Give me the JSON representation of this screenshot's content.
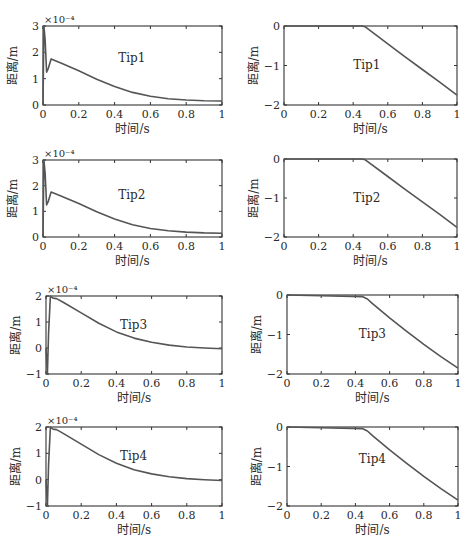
{
  "figure": {
    "xlabel": "时间/s",
    "ylabel": "距离/m",
    "exponent_label": "×10⁻⁴",
    "line_color": "#555555",
    "axis_color": "#333333"
  },
  "chart_data": [
    {
      "type": "line",
      "id": "left-1",
      "annotation": "Tip1",
      "xlabel": "时间/s",
      "ylabel": "距离/m",
      "y_scale_label": "×10⁻⁴",
      "xlim": [
        0,
        1
      ],
      "ylim": [
        0,
        3
      ],
      "xticks": [
        "0",
        "0.2",
        "0.4",
        "0.6",
        "0.8",
        "1"
      ],
      "yticks": [
        "0",
        "1",
        "2",
        "3"
      ],
      "grid": false,
      "x": [
        0,
        0.005,
        0.012,
        0.02,
        0.03,
        0.045,
        0.1,
        0.2,
        0.3,
        0.4,
        0.5,
        0.6,
        0.7,
        0.8,
        0.9,
        1.0
      ],
      "values": [
        0,
        3.0,
        2.5,
        1.25,
        1.4,
        1.75,
        1.6,
        1.3,
        0.98,
        0.7,
        0.48,
        0.33,
        0.24,
        0.19,
        0.16,
        0.15
      ]
    },
    {
      "type": "line",
      "id": "right-1",
      "annotation": "Tip1",
      "xlabel": "时间/s",
      "ylabel": "距离/m",
      "xlim": [
        0,
        1
      ],
      "ylim": [
        -2,
        0
      ],
      "xticks": [
        "0",
        "0.2",
        "0.4",
        "0.6",
        "0.8",
        "1"
      ],
      "yticks": [
        "0",
        "-1",
        "-1",
        "-2"
      ],
      "yticks_values": [
        0,
        -1,
        -2
      ],
      "grid": false,
      "x": [
        0,
        0.45,
        0.47,
        0.6,
        0.7,
        0.8,
        0.9,
        1.0
      ],
      "values": [
        0,
        0,
        -0.02,
        -0.45,
        -0.78,
        -1.1,
        -1.42,
        -1.75
      ]
    },
    {
      "type": "line",
      "id": "left-2",
      "annotation": "Tip2",
      "xlabel": "时间/s",
      "ylabel": "距离/m",
      "y_scale_label": "×10⁻⁴",
      "xlim": [
        0,
        1
      ],
      "ylim": [
        0,
        3
      ],
      "xticks": [
        "0",
        "0.2",
        "0.4",
        "0.6",
        "0.8",
        "1"
      ],
      "yticks": [
        "0",
        "1",
        "2",
        "3"
      ],
      "grid": false,
      "x": [
        0,
        0.005,
        0.012,
        0.02,
        0.03,
        0.045,
        0.1,
        0.2,
        0.3,
        0.4,
        0.5,
        0.6,
        0.7,
        0.8,
        0.9,
        1.0
      ],
      "values": [
        0,
        3.0,
        2.5,
        1.25,
        1.4,
        1.75,
        1.6,
        1.3,
        0.98,
        0.7,
        0.48,
        0.33,
        0.24,
        0.19,
        0.16,
        0.15
      ]
    },
    {
      "type": "line",
      "id": "right-2",
      "annotation": "Tip2",
      "xlabel": "时间/s",
      "ylabel": "距离/m",
      "xlim": [
        0,
        1
      ],
      "ylim": [
        -2,
        0
      ],
      "xticks": [
        "0",
        "0.2",
        "0.4",
        "0.6",
        "0.8",
        "1"
      ],
      "yticks_values": [
        0,
        -1,
        -2
      ],
      "grid": false,
      "x": [
        0,
        0.45,
        0.47,
        0.6,
        0.7,
        0.8,
        0.9,
        1.0
      ],
      "values": [
        0,
        0,
        -0.02,
        -0.45,
        -0.78,
        -1.1,
        -1.42,
        -1.75
      ]
    },
    {
      "type": "line",
      "id": "left-3",
      "annotation": "Tip3",
      "xlabel": "时间/s",
      "ylabel": "距离/m",
      "y_scale_label": "×10⁻⁴",
      "xlim": [
        0,
        1
      ],
      "ylim": [
        -1,
        2
      ],
      "xticks": [
        "0",
        "0.2",
        "0.4",
        "0.6",
        "0.8",
        "1"
      ],
      "yticks": [
        "-1",
        "0",
        "1",
        "2"
      ],
      "grid": false,
      "x": [
        0,
        0.008,
        0.015,
        0.025,
        0.04,
        0.06,
        0.1,
        0.2,
        0.3,
        0.4,
        0.5,
        0.6,
        0.7,
        0.8,
        0.9,
        1.0
      ],
      "values": [
        0,
        -1.0,
        0.6,
        2.0,
        1.92,
        1.9,
        1.75,
        1.35,
        0.95,
        0.62,
        0.38,
        0.22,
        0.11,
        0.04,
        0.0,
        -0.03
      ]
    },
    {
      "type": "line",
      "id": "right-3",
      "annotation": "Tip3",
      "xlabel": "时间/s",
      "ylabel": "距离/m",
      "xlim": [
        0,
        1
      ],
      "ylim": [
        -2,
        0
      ],
      "xticks": [
        "0",
        "0.2",
        "0.4",
        "0.6",
        "0.8",
        "1"
      ],
      "yticks_values": [
        0,
        -1,
        -2
      ],
      "grid": false,
      "x": [
        0,
        0.2,
        0.44,
        0.47,
        0.5,
        0.6,
        0.7,
        0.8,
        0.9,
        1.0
      ],
      "values": [
        0,
        -0.02,
        -0.04,
        -0.1,
        -0.22,
        -0.58,
        -0.92,
        -1.25,
        -1.56,
        -1.85
      ]
    },
    {
      "type": "line",
      "id": "left-4",
      "annotation": "Tip4",
      "xlabel": "时间/s",
      "ylabel": "距离/m",
      "y_scale_label": "×10⁻⁴",
      "xlim": [
        0,
        1
      ],
      "ylim": [
        -1,
        2
      ],
      "xticks": [
        "0",
        "0.2",
        "0.4",
        "0.6",
        "0.8",
        "1"
      ],
      "yticks": [
        "-1",
        "0",
        "1",
        "2"
      ],
      "grid": false,
      "x": [
        0,
        0.008,
        0.015,
        0.025,
        0.04,
        0.06,
        0.1,
        0.2,
        0.3,
        0.4,
        0.5,
        0.6,
        0.7,
        0.8,
        0.9,
        1.0
      ],
      "values": [
        0,
        -1.0,
        0.6,
        2.0,
        1.92,
        1.9,
        1.75,
        1.35,
        0.95,
        0.62,
        0.38,
        0.22,
        0.11,
        0.04,
        0.0,
        -0.03
      ]
    },
    {
      "type": "line",
      "id": "right-4",
      "annotation": "Tip4",
      "xlabel": "时间/s",
      "ylabel": "距离/m",
      "xlim": [
        0,
        1
      ],
      "ylim": [
        -2,
        0
      ],
      "xticks": [
        "0",
        "0.2",
        "0.4",
        "0.6",
        "0.8",
        "1"
      ],
      "yticks_values": [
        0,
        -1,
        -2
      ],
      "grid": false,
      "x": [
        0,
        0.2,
        0.44,
        0.47,
        0.5,
        0.6,
        0.7,
        0.8,
        0.9,
        1.0
      ],
      "values": [
        0,
        -0.02,
        -0.04,
        -0.1,
        -0.22,
        -0.58,
        -0.92,
        -1.25,
        -1.56,
        -1.85
      ]
    }
  ],
  "layout": {
    "panels": [
      {
        "left": 43,
        "top": 26,
        "width": 179,
        "height": 79,
        "annot_x": 0.42,
        "annot_y": 0.45,
        "show_xtick0": false
      },
      {
        "left": 284,
        "top": 26,
        "width": 173,
        "height": 79,
        "annot_x": 0.4,
        "annot_y": 0.55,
        "show_xtick0": true
      },
      {
        "left": 43,
        "top": 160,
        "width": 179,
        "height": 77,
        "annot_x": 0.42,
        "annot_y": 0.5,
        "show_xtick0": true
      },
      {
        "left": 284,
        "top": 159,
        "width": 173,
        "height": 78,
        "annot_x": 0.4,
        "annot_y": 0.55,
        "show_xtick0": true
      },
      {
        "left": 46,
        "top": 296,
        "width": 176,
        "height": 78,
        "annot_x": 0.42,
        "annot_y": 0.42,
        "show_xtick0": true
      },
      {
        "left": 287,
        "top": 295,
        "width": 171,
        "height": 79,
        "annot_x": 0.42,
        "annot_y": 0.55,
        "show_xtick0": true
      },
      {
        "left": 46,
        "top": 427,
        "width": 176,
        "height": 79,
        "annot_x": 0.42,
        "annot_y": 0.42,
        "show_xtick0": true
      },
      {
        "left": 287,
        "top": 427,
        "width": 171,
        "height": 79,
        "annot_x": 0.42,
        "annot_y": 0.45,
        "show_xtick0": true
      }
    ]
  }
}
